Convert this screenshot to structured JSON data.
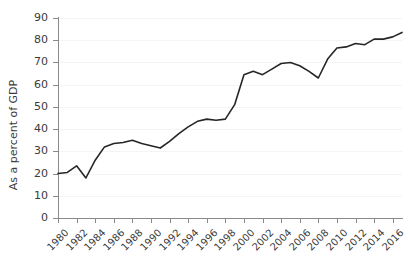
{
  "chart_data": {
    "type": "line",
    "title": "",
    "xlabel": "",
    "ylabel": "As a percent of GDP",
    "ylim": [
      0,
      90
    ],
    "xlim": [
      1980,
      2017
    ],
    "grid": true,
    "legend": null,
    "y_ticks": [
      0,
      10,
      20,
      30,
      40,
      50,
      60,
      70,
      80,
      90
    ],
    "x_tick_labels": [
      "1980",
      "1982",
      "1984",
      "1986",
      "1988",
      "1990",
      "1992",
      "1994",
      "1996",
      "1998",
      "2000",
      "2002",
      "2004",
      "2006",
      "2008",
      "2010",
      "2012",
      "2014",
      "2016"
    ],
    "x_tick_values": [
      1980,
      1982,
      1984,
      1986,
      1988,
      1990,
      1992,
      1994,
      1996,
      1998,
      2000,
      2002,
      2004,
      2006,
      2008,
      2010,
      2012,
      2014,
      2016
    ],
    "series": [
      {
        "name": "As a percent of GDP",
        "color": "#262626",
        "x": [
          1980,
          1981,
          1982,
          1983,
          1984,
          1985,
          1986,
          1987,
          1988,
          1989,
          1990,
          1991,
          1992,
          1993,
          1994,
          1995,
          1996,
          1997,
          1998,
          1999,
          2000,
          2001,
          2002,
          2003,
          2004,
          2005,
          2006,
          2007,
          2008,
          2009,
          2010,
          2011,
          2012,
          2013,
          2014,
          2015,
          2016,
          2017
        ],
        "values": [
          20.0,
          20.5,
          23.5,
          18.0,
          26.0,
          32.0,
          33.5,
          34.0,
          35.0,
          33.5,
          32.5,
          31.5,
          34.5,
          38.0,
          41.0,
          43.5,
          44.5,
          44.0,
          44.5,
          51.0,
          64.5,
          66.0,
          64.5,
          67.0,
          69.5,
          70.0,
          68.5,
          66.0,
          63.0,
          71.5,
          76.5,
          77.0,
          78.5,
          78.0,
          80.5,
          80.5,
          81.5,
          83.5
        ]
      }
    ]
  },
  "axis": {
    "y_axis_label": "As a percent of GDP"
  }
}
